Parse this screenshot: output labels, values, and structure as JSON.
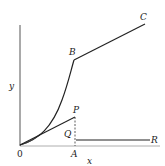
{
  "diagram": {
    "labels": {
      "origin": "0",
      "x_axis": "x",
      "y_axis": "y",
      "B": "B",
      "C": "C",
      "P": "P",
      "Q": "Q",
      "A": "A",
      "R": "R"
    },
    "colors": {
      "stroke": "#222222",
      "axis": "#555555",
      "background": "#ffffff"
    }
  }
}
